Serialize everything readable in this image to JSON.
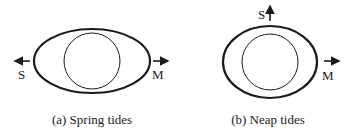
{
  "panels": [
    {
      "caption": "(a) Spring tides",
      "sun_label": "S",
      "moon_label": "M",
      "sun_direction": "left",
      "moon_direction": "right"
    },
    {
      "caption": "(b) Neap tides",
      "sun_label": "S",
      "moon_label": "M",
      "sun_direction": "up",
      "moon_direction": "right"
    }
  ],
  "colors": {
    "stroke": "#1a1a1a",
    "background": "#ffffff"
  }
}
